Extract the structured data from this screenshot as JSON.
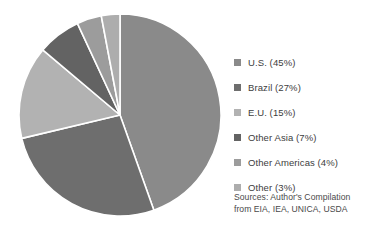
{
  "chart_data": {
    "type": "pie",
    "title": "",
    "subtitle": "",
    "xlabel": "",
    "ylabel": "",
    "grid": false,
    "legend_position": "right",
    "start_angle_deg": 0,
    "direction": "clockwise",
    "categories": [
      "U.S.",
      "Brazil",
      "E.U.",
      "Other Asia",
      "Other Americas",
      "Other"
    ],
    "values": [
      45,
      27,
      15,
      7,
      4,
      3
    ],
    "value_unit": "%",
    "colors": [
      "#8a8a8a",
      "#6e6e6e",
      "#b2b2b2",
      "#636363",
      "#9c9c9c",
      "#adadad"
    ],
    "slice_separator_color": "#ffffff",
    "labels": [
      "U.S. (45%)",
      "Brazil (27%)",
      "E.U. (15%)",
      "Other Asia (7%)",
      "Other Americas (4%)",
      "Other (3%)"
    ],
    "annotations": [
      "Sources: Author's Compilation",
      "from EIA, IEA, UNICA, USDA"
    ]
  },
  "legend": {
    "items": [
      {
        "label": "U.S. (45%)",
        "swatch_color": "#8a8a8a",
        "value": 45,
        "category": "U.S."
      },
      {
        "label": "Brazil (27%)",
        "swatch_color": "#6e6e6e",
        "value": 27,
        "category": "Brazil"
      },
      {
        "label": "E.U. (15%)",
        "swatch_color": "#b2b2b2",
        "value": 15,
        "category": "E.U."
      },
      {
        "label": "Other Asia (7%)",
        "swatch_color": "#636363",
        "value": 7,
        "category": "Other Asia"
      },
      {
        "label": "Other Americas (4%)",
        "swatch_color": "#9c9c9c",
        "value": 4,
        "category": "Other Americas"
      },
      {
        "label": "Other (3%)",
        "swatch_color": "#adadad",
        "value": 3,
        "category": "Other"
      }
    ]
  },
  "source": {
    "line1": "Sources: Author's Compilation",
    "line2": "from EIA, IEA, UNICA, USDA"
  }
}
